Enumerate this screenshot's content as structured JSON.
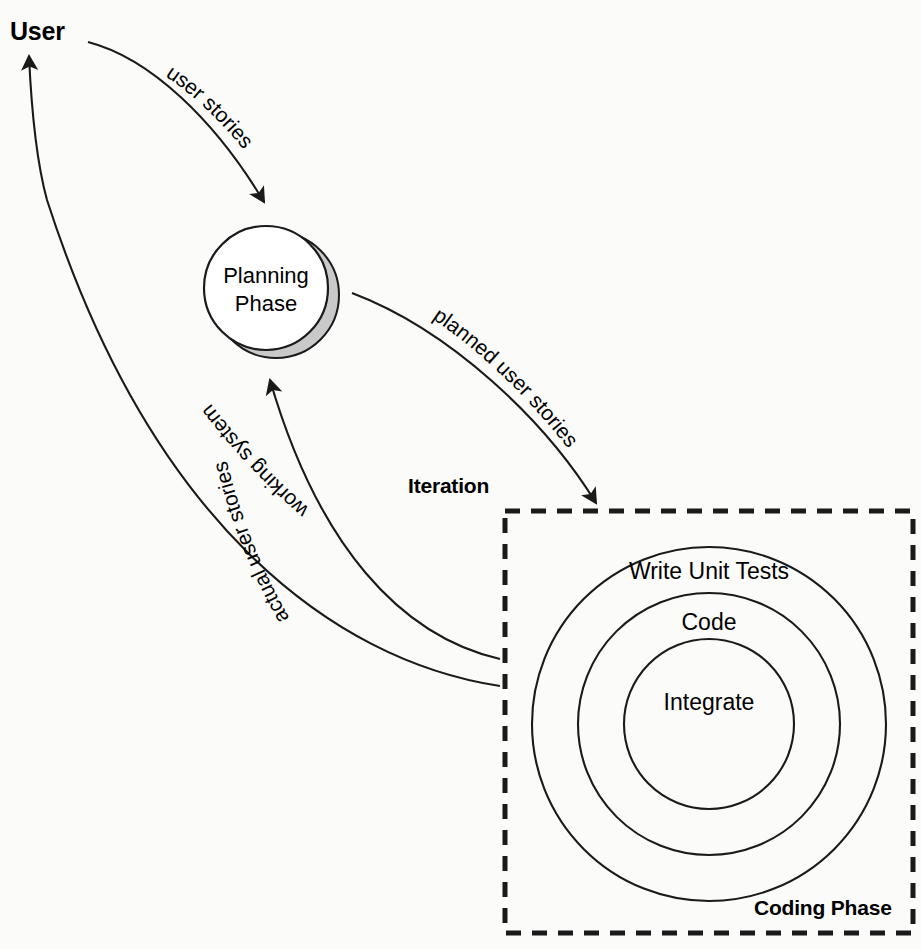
{
  "diagram": {
    "colors": {
      "stroke": "#1a1a1a",
      "shadow": "#c9c9c9",
      "background": "#fbfbfa",
      "text": "#000000"
    },
    "nodes": {
      "user": {
        "label": "User",
        "bold": true
      },
      "planning_phase": {
        "line1": "Planning",
        "line2": "Phase"
      },
      "iteration": {
        "label": "Iteration",
        "bold": true
      },
      "coding_phase": {
        "label": "Coding Phase",
        "bold": true
      },
      "rings": [
        {
          "label": "Write Unit Tests"
        },
        {
          "label": "Code"
        },
        {
          "label": "Integrate"
        }
      ]
    },
    "edges": [
      {
        "label": "user stories",
        "from": "User",
        "to": "Planning Phase"
      },
      {
        "label": "planned user stories",
        "from": "Planning Phase",
        "to": "Coding Phase"
      },
      {
        "label": "actual user stories",
        "from": "Coding Phase",
        "to": "Planning Phase"
      },
      {
        "label": "working system",
        "from": "Coding Phase",
        "to": "User"
      }
    ]
  }
}
